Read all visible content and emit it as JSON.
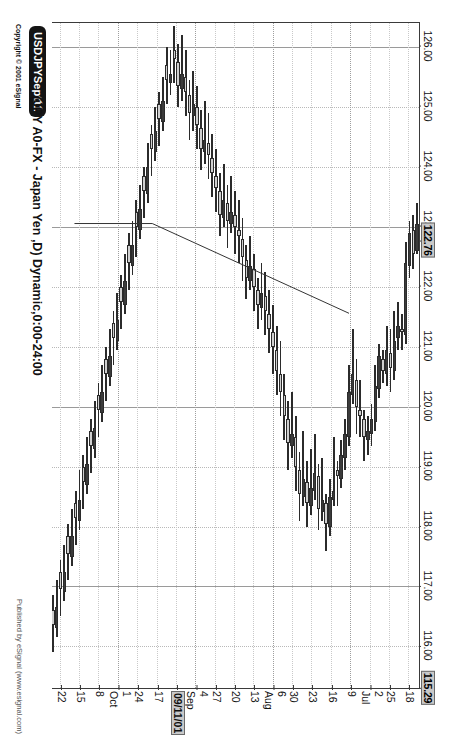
{
  "window": {
    "symbol_badge": "USDJPYSept11",
    "subtitle": "(JPY A0-FX - Japan Yen ,D) Dynamic,0:00-24:00",
    "copyright": "Copyright © 2001 eSignal",
    "published": "Published by eSignal (www.esignal.com)"
  },
  "chart_data": {
    "type": "candlestick",
    "title": "USDJPYSept11",
    "subtitle": "(JPY A0-FX - Japan Yen ,D) Dynamic,0:00-24:00",
    "xlabel": "",
    "ylabel": "",
    "orientation": "rotated-90",
    "grid": true,
    "legend": "none",
    "ylim": [
      115.29,
      126.4
    ],
    "y_ticks": [
      "126.00",
      "125.00",
      "124.00",
      "123.00",
      "122.00",
      "121.00",
      "120.00",
      "119.00",
      "118.00",
      "117.00",
      "116.00"
    ],
    "y_highlight_labels": [
      "122.76",
      "115.29"
    ],
    "last_price": "122.76",
    "axis_low_label": "115.29",
    "x_ticks": [
      {
        "label": "18",
        "sub": ""
      },
      {
        "label": "25",
        "sub": ""
      },
      {
        "label": "2",
        "sub": "Jul"
      },
      {
        "label": "9",
        "sub": ""
      },
      {
        "label": "16",
        "sub": ""
      },
      {
        "label": "23",
        "sub": ""
      },
      {
        "label": "30",
        "sub": ""
      },
      {
        "label": "6",
        "sub": "Aug"
      },
      {
        "label": "13",
        "sub": ""
      },
      {
        "label": "20",
        "sub": ""
      },
      {
        "label": "27",
        "sub": ""
      },
      {
        "label": "4",
        "sub": "Sep"
      },
      {
        "label": "09/11/01",
        "sub": "",
        "highlight": true
      },
      {
        "label": "17",
        "sub": ""
      },
      {
        "label": "24",
        "sub": ""
      },
      {
        "label": "1",
        "sub": "Oct"
      },
      {
        "label": "8",
        "sub": ""
      },
      {
        "label": "15",
        "sub": ""
      },
      {
        "label": "22",
        "sub": ""
      }
    ],
    "annotations": [
      {
        "type": "trendline",
        "from": {
          "x_index": 18,
          "price": 121.55
        },
        "to": {
          "x_index": 70,
          "price": 123.05
        }
      }
    ],
    "ohlc": [
      {
        "o": 123.05,
        "h": 123.4,
        "l": 122.55,
        "c": 122.6
      },
      {
        "o": 122.55,
        "h": 123.2,
        "l": 122.3,
        "c": 122.95
      },
      {
        "o": 122.9,
        "h": 123.1,
        "l": 122.15,
        "c": 122.35
      },
      {
        "o": 122.4,
        "h": 122.75,
        "l": 121.05,
        "c": 121.2
      },
      {
        "o": 121.25,
        "h": 121.55,
        "l": 120.95,
        "c": 121.3
      },
      {
        "o": 121.35,
        "h": 121.75,
        "l": 120.95,
        "c": 121.15
      },
      {
        "o": 121.1,
        "h": 121.6,
        "l": 120.45,
        "c": 120.6
      },
      {
        "o": 120.65,
        "h": 121.3,
        "l": 120.25,
        "c": 120.9
      },
      {
        "o": 120.95,
        "h": 121.35,
        "l": 120.35,
        "c": 120.55
      },
      {
        "o": 120.6,
        "h": 120.95,
        "l": 120.4,
        "c": 120.8
      },
      {
        "o": 120.85,
        "h": 121.05,
        "l": 120.15,
        "c": 120.3
      },
      {
        "o": 120.35,
        "h": 120.7,
        "l": 119.6,
        "c": 119.75
      },
      {
        "o": 119.8,
        "h": 120.05,
        "l": 119.35,
        "c": 119.55
      },
      {
        "o": 119.6,
        "h": 119.85,
        "l": 119.2,
        "c": 119.45
      },
      {
        "o": 119.5,
        "h": 119.95,
        "l": 119.1,
        "c": 119.8
      },
      {
        "o": 119.85,
        "h": 120.45,
        "l": 119.5,
        "c": 119.95
      },
      {
        "o": 120.0,
        "h": 120.8,
        "l": 119.55,
        "c": 120.45
      },
      {
        "o": 120.55,
        "h": 121.3,
        "l": 120.05,
        "c": 120.2
      },
      {
        "o": 120.25,
        "h": 120.7,
        "l": 119.35,
        "c": 119.5
      },
      {
        "o": 119.55,
        "h": 119.8,
        "l": 118.95,
        "c": 119.15
      },
      {
        "o": 119.2,
        "h": 119.45,
        "l": 118.65,
        "c": 118.8
      },
      {
        "o": 118.85,
        "h": 119.1,
        "l": 118.35,
        "c": 118.95
      },
      {
        "o": 118.6,
        "h": 119.5,
        "l": 118.35,
        "c": 118.45
      },
      {
        "o": 118.5,
        "h": 118.8,
        "l": 117.85,
        "c": 118.0
      },
      {
        "o": 118.05,
        "h": 118.55,
        "l": 117.6,
        "c": 118.4
      },
      {
        "o": 118.45,
        "h": 119.15,
        "l": 118.1,
        "c": 118.25
      },
      {
        "o": 118.3,
        "h": 119.05,
        "l": 117.95,
        "c": 118.85
      },
      {
        "o": 118.9,
        "h": 119.55,
        "l": 118.45,
        "c": 118.6
      },
      {
        "o": 118.65,
        "h": 119.3,
        "l": 118.2,
        "c": 118.35
      },
      {
        "o": 118.4,
        "h": 119.1,
        "l": 118.0,
        "c": 118.75
      },
      {
        "o": 118.8,
        "h": 119.6,
        "l": 118.35,
        "c": 118.5
      },
      {
        "o": 118.55,
        "h": 119.25,
        "l": 118.1,
        "c": 118.95
      },
      {
        "o": 119.0,
        "h": 119.85,
        "l": 118.6,
        "c": 119.5
      },
      {
        "o": 119.55,
        "h": 120.25,
        "l": 119.15,
        "c": 119.35
      },
      {
        "o": 119.4,
        "h": 120.1,
        "l": 118.95,
        "c": 119.8
      },
      {
        "o": 119.85,
        "h": 120.55,
        "l": 119.45,
        "c": 120.2
      },
      {
        "o": 120.25,
        "h": 121.1,
        "l": 119.85,
        "c": 120.55
      },
      {
        "o": 120.6,
        "h": 121.35,
        "l": 120.2,
        "c": 120.95
      },
      {
        "o": 121.0,
        "h": 121.7,
        "l": 120.55,
        "c": 121.25
      },
      {
        "o": 121.3,
        "h": 121.95,
        "l": 120.9,
        "c": 121.55
      },
      {
        "o": 121.6,
        "h": 122.25,
        "l": 121.2,
        "c": 121.85
      },
      {
        "o": 121.9,
        "h": 122.4,
        "l": 121.45,
        "c": 121.65
      },
      {
        "o": 121.7,
        "h": 122.15,
        "l": 121.3,
        "c": 121.95
      },
      {
        "o": 122.0,
        "h": 122.55,
        "l": 121.6,
        "c": 122.3
      },
      {
        "o": 122.35,
        "h": 122.85,
        "l": 121.95,
        "c": 122.1
      },
      {
        "o": 122.15,
        "h": 122.7,
        "l": 121.8,
        "c": 122.45
      },
      {
        "o": 122.5,
        "h": 123.15,
        "l": 122.1,
        "c": 122.8
      },
      {
        "o": 122.85,
        "h": 123.45,
        "l": 122.4,
        "c": 122.95
      },
      {
        "o": 123.0,
        "h": 123.6,
        "l": 122.55,
        "c": 123.2
      },
      {
        "o": 123.25,
        "h": 123.85,
        "l": 122.9,
        "c": 123.05
      },
      {
        "o": 123.1,
        "h": 123.7,
        "l": 122.65,
        "c": 123.4
      },
      {
        "o": 123.45,
        "h": 124.05,
        "l": 123.0,
        "c": 123.15
      },
      {
        "o": 123.2,
        "h": 123.9,
        "l": 122.85,
        "c": 123.6
      },
      {
        "o": 123.65,
        "h": 124.3,
        "l": 123.25,
        "c": 123.85
      },
      {
        "o": 123.9,
        "h": 124.55,
        "l": 123.5,
        "c": 124.15
      },
      {
        "o": 124.2,
        "h": 124.9,
        "l": 123.8,
        "c": 124.4
      },
      {
        "o": 124.45,
        "h": 125.1,
        "l": 124.05,
        "c": 124.25
      },
      {
        "o": 124.3,
        "h": 124.95,
        "l": 123.95,
        "c": 124.65
      },
      {
        "o": 124.7,
        "h": 125.35,
        "l": 124.3,
        "c": 125.0
      },
      {
        "o": 125.05,
        "h": 125.6,
        "l": 124.6,
        "c": 124.85
      },
      {
        "o": 124.9,
        "h": 125.45,
        "l": 124.45,
        "c": 125.2
      },
      {
        "o": 125.25,
        "h": 125.95,
        "l": 124.85,
        "c": 125.5
      },
      {
        "o": 125.55,
        "h": 126.2,
        "l": 125.1,
        "c": 125.3
      },
      {
        "o": 125.35,
        "h": 126.05,
        "l": 125.0,
        "c": 125.75
      },
      {
        "o": 125.8,
        "h": 126.35,
        "l": 125.4,
        "c": 125.95
      },
      {
        "o": 125.55,
        "h": 125.95,
        "l": 125.2,
        "c": 125.4
      },
      {
        "o": 125.45,
        "h": 126.0,
        "l": 125.05,
        "c": 125.7
      },
      {
        "o": 125.1,
        "h": 125.5,
        "l": 124.6,
        "c": 124.75
      },
      {
        "o": 124.8,
        "h": 125.25,
        "l": 124.35,
        "c": 125.05
      },
      {
        "o": 124.6,
        "h": 125.0,
        "l": 124.1,
        "c": 124.25
      },
      {
        "o": 124.3,
        "h": 124.7,
        "l": 123.85,
        "c": 124.55
      },
      {
        "o": 124.0,
        "h": 124.4,
        "l": 123.4,
        "c": 123.55
      },
      {
        "o": 123.6,
        "h": 124.0,
        "l": 123.15,
        "c": 123.85
      },
      {
        "o": 123.3,
        "h": 123.7,
        "l": 122.8,
        "c": 122.95
      },
      {
        "o": 123.0,
        "h": 123.45,
        "l": 122.5,
        "c": 123.25
      },
      {
        "o": 122.7,
        "h": 123.1,
        "l": 122.2,
        "c": 122.35
      },
      {
        "o": 122.4,
        "h": 122.9,
        "l": 121.95,
        "c": 122.7
      },
      {
        "o": 122.1,
        "h": 122.55,
        "l": 121.55,
        "c": 121.7
      },
      {
        "o": 121.75,
        "h": 122.2,
        "l": 121.3,
        "c": 122.0
      },
      {
        "o": 121.45,
        "h": 121.9,
        "l": 120.95,
        "c": 121.1
      },
      {
        "o": 121.15,
        "h": 121.6,
        "l": 120.7,
        "c": 121.4
      },
      {
        "o": 120.85,
        "h": 121.3,
        "l": 120.35,
        "c": 120.5
      },
      {
        "o": 120.55,
        "h": 121.0,
        "l": 120.1,
        "c": 120.8
      },
      {
        "o": 120.25,
        "h": 120.7,
        "l": 119.75,
        "c": 119.9
      },
      {
        "o": 119.95,
        "h": 120.4,
        "l": 119.5,
        "c": 120.2
      },
      {
        "o": 119.65,
        "h": 120.1,
        "l": 119.15,
        "c": 119.3
      },
      {
        "o": 119.35,
        "h": 119.8,
        "l": 118.9,
        "c": 119.6
      },
      {
        "o": 119.05,
        "h": 119.5,
        "l": 118.55,
        "c": 118.7
      },
      {
        "o": 118.75,
        "h": 119.2,
        "l": 118.3,
        "c": 119.0
      },
      {
        "o": 118.45,
        "h": 118.95,
        "l": 117.95,
        "c": 118.1
      },
      {
        "o": 118.15,
        "h": 118.6,
        "l": 117.7,
        "c": 118.4
      },
      {
        "o": 117.85,
        "h": 118.3,
        "l": 117.35,
        "c": 117.5
      },
      {
        "o": 117.55,
        "h": 118.05,
        "l": 117.1,
        "c": 117.85
      },
      {
        "o": 117.25,
        "h": 117.7,
        "l": 116.75,
        "c": 116.9
      },
      {
        "o": 116.95,
        "h": 117.45,
        "l": 116.5,
        "c": 117.25
      },
      {
        "o": 116.65,
        "h": 117.1,
        "l": 116.15,
        "c": 116.3
      },
      {
        "o": 116.35,
        "h": 116.85,
        "l": 115.9,
        "c": 116.6
      }
    ]
  }
}
